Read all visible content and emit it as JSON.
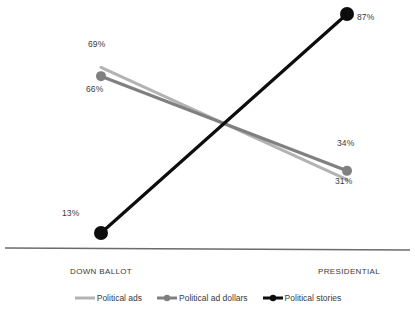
{
  "chart_data": {
    "type": "line",
    "title": "",
    "subtitle": "",
    "xlabel": "",
    "ylabel": "",
    "categories": [
      "DOWN BALLOT",
      "PRESIDENTIAL"
    ],
    "grid": false,
    "legend_position": "bottom",
    "ylim": [
      0,
      100
    ],
    "series": [
      {
        "name": "Political ads",
        "color": "#b3b3b3",
        "values": [
          69,
          31
        ],
        "labels": [
          "69%",
          "31%"
        ],
        "marker": false
      },
      {
        "name": "Political ad dollars",
        "color": "#808080",
        "values": [
          66,
          34
        ],
        "labels": [
          "66%",
          "34%"
        ],
        "marker": true
      },
      {
        "name": "Political stories",
        "color": "#0d0d0d",
        "values": [
          13,
          87
        ],
        "labels": [
          "13%",
          "87%"
        ],
        "marker": true
      }
    ],
    "annotations": [
      {
        "name": "label-ads-down-ballot",
        "text": "69%",
        "x": 88,
        "y": 40
      },
      {
        "name": "label-dollars-down-ballot",
        "text": "66%",
        "x": 86,
        "y": 85
      },
      {
        "name": "label-stories-down-ballot",
        "text": "13%",
        "x": 62,
        "y": 209
      },
      {
        "name": "label-stories-presidential",
        "text": "87%",
        "x": 357,
        "y": 13
      },
      {
        "name": "label-dollars-presidential",
        "text": "34%",
        "x": 337,
        "y": 139
      },
      {
        "name": "label-ads-presidential",
        "text": "31%",
        "x": 335,
        "y": 177
      }
    ],
    "axis_color": "#6b6b6b",
    "background": "#ffffff"
  },
  "axis": {
    "x_categories": [
      {
        "label": "DOWN BALLOT",
        "x": 70,
        "y": 268
      },
      {
        "label": "PRESIDENTIAL",
        "x": 318,
        "y": 268
      }
    ]
  },
  "legend": {
    "items": [
      {
        "label": "Political ads",
        "color": "#b3b3b3",
        "marker": false
      },
      {
        "label": "Political ad dollars",
        "color": "#808080",
        "marker": true
      },
      {
        "label": "Political stories",
        "color": "#0d0d0d",
        "marker": true
      }
    ]
  }
}
